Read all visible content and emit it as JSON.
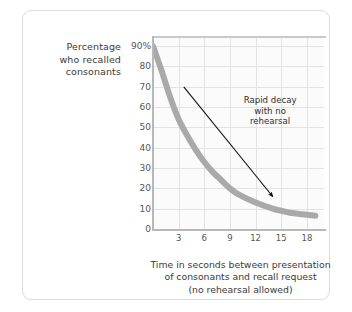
{
  "chart_data": {
    "type": "line",
    "title": "",
    "ylabel_lines": [
      "Percentage",
      "who recalled",
      "consonants"
    ],
    "xlabel_lines": [
      "Time in seconds between presentation",
      "of consonants and recall request",
      "(no rehearsal allowed)"
    ],
    "yticks": [
      "90%",
      "80",
      "70",
      "60",
      "50",
      "40",
      "30",
      "20",
      "10",
      "0"
    ],
    "ytick_values": [
      90,
      80,
      70,
      60,
      50,
      40,
      30,
      20,
      10,
      0
    ],
    "xticks": [
      "3",
      "6",
      "9",
      "12",
      "15",
      "18"
    ],
    "xtick_values": [
      3,
      6,
      9,
      12,
      15,
      18
    ],
    "xlim": [
      0,
      20
    ],
    "ylim": [
      0,
      95
    ],
    "grid": true,
    "legend": "none",
    "series": [
      {
        "name": "Recall with no rehearsal",
        "color": "#a9a9a9",
        "x": [
          0,
          1,
          2,
          3,
          4,
          5,
          6,
          7,
          8,
          9,
          10,
          12,
          14,
          15,
          16,
          18,
          19
        ],
        "values": [
          90,
          78,
          65,
          54,
          46,
          39,
          33,
          28,
          24,
          20,
          17,
          13,
          10,
          9,
          8,
          7,
          6.5
        ]
      }
    ],
    "annotations": [
      {
        "text_lines": [
          "Rapid decay",
          "with no",
          "rehearsal"
        ],
        "arrow_from": [
          3.6,
          70
        ],
        "arrow_to": [
          14.0,
          16
        ]
      }
    ],
    "colors": {
      "curve": "#a9a9a9",
      "grid": "#e3e3e3",
      "axis": "#b8b8b8",
      "plot_background": "#fbfbfb",
      "page_background": "#ffffff",
      "frame_border": "#dcdcdc",
      "text": "#3a3a3a",
      "arrow": "#111111"
    }
  }
}
